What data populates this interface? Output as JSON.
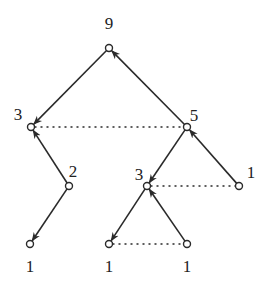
{
  "diagram": {
    "type": "tree-with-pointers",
    "nodes": [
      {
        "id": "n9",
        "label": "9",
        "x": 109,
        "y": 48,
        "lx": 109,
        "ly": 29
      },
      {
        "id": "n3a",
        "label": "3",
        "x": 31,
        "y": 127,
        "lx": 18,
        "ly": 120
      },
      {
        "id": "n5",
        "label": "5",
        "x": 187,
        "y": 127,
        "lx": 194,
        "ly": 121
      },
      {
        "id": "n2",
        "label": "2",
        "x": 69,
        "y": 186,
        "lx": 73,
        "ly": 177
      },
      {
        "id": "n3b",
        "label": "3",
        "x": 147,
        "y": 186,
        "lx": 139,
        "ly": 180
      },
      {
        "id": "n1r",
        "label": "1",
        "x": 239,
        "y": 186,
        "lx": 251,
        "ly": 178
      },
      {
        "id": "n1a",
        "label": "1",
        "x": 30,
        "y": 244,
        "lx": 30,
        "ly": 272
      },
      {
        "id": "n1b",
        "label": "1",
        "x": 109,
        "y": 244,
        "lx": 109,
        "ly": 272
      },
      {
        "id": "n1c",
        "label": "1",
        "x": 187,
        "y": 244,
        "lx": 187,
        "ly": 272
      }
    ],
    "edges": [
      {
        "from": "n9",
        "to": "n3a",
        "style": "solid-arrow"
      },
      {
        "from": "n5",
        "to": "n9",
        "style": "solid-arrow"
      },
      {
        "from": "n2",
        "to": "n3a",
        "style": "solid-arrow"
      },
      {
        "from": "n2",
        "to": "n1a",
        "style": "solid-arrow"
      },
      {
        "from": "n5",
        "to": "n3b",
        "style": "solid-arrow"
      },
      {
        "from": "n1r",
        "to": "n5",
        "style": "solid-arrow"
      },
      {
        "from": "n3b",
        "to": "n1b",
        "style": "solid-arrow"
      },
      {
        "from": "n1c",
        "to": "n3b",
        "style": "solid-arrow"
      },
      {
        "from": "n3a",
        "to": "n5",
        "style": "dotted"
      },
      {
        "from": "n3b",
        "to": "n1r",
        "style": "dotted"
      },
      {
        "from": "n1b",
        "to": "n1c",
        "style": "dotted"
      }
    ]
  }
}
